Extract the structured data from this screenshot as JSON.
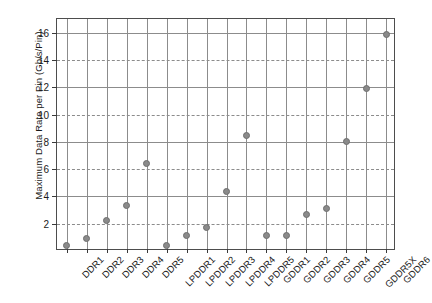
{
  "chart_data": {
    "type": "scatter",
    "title": "",
    "xlabel": "",
    "ylabel": "Maximum Data Rate per Pin (Gb/s/Pin)",
    "categories": [
      "DDR1",
      "DDR2",
      "DDR3",
      "DDR4",
      "DDR5",
      "LPDDR1",
      "LPDDR2",
      "LPDDR3",
      "LPDDR4",
      "LPDDR5",
      "GDDR1",
      "GDDR2",
      "GDDR3",
      "GDDR4",
      "GDDR5",
      "GDDR5X",
      "GDDR6"
    ],
    "values": [
      0.4,
      0.9,
      2.2,
      3.3,
      6.4,
      0.4,
      1.1,
      1.75,
      4.35,
      8.5,
      1.1,
      1.1,
      2.7,
      3.1,
      8.0,
      11.9,
      15.9
    ],
    "ylim": [
      0,
      17
    ],
    "yticks": [
      2,
      4,
      6,
      8,
      10,
      12,
      14,
      16
    ],
    "ytick_labels": [
      "2",
      "4",
      "6",
      "8",
      "10",
      "12",
      "14",
      "16"
    ],
    "grid": "both-axes",
    "gridline_style_by_tick": [
      "dashed",
      "solid",
      "dashed",
      "solid",
      "dashed",
      "solid",
      "dashed",
      "solid"
    ],
    "legend": "none",
    "marker": {
      "shape": "circle",
      "fill_color": "#8a8a8a",
      "edge_color": "#6e6e6e"
    },
    "colors": {
      "background": "#ffffff",
      "axis": "#4d4d4d",
      "grid": "#8c8c8c",
      "text": "#1a1a1a"
    }
  }
}
